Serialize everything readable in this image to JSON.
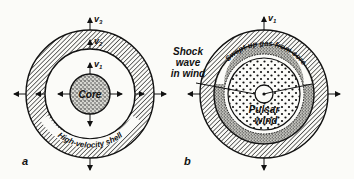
{
  "figure": {
    "panel_a": {
      "letter": "a",
      "labels": {
        "core": "Core",
        "shell": "High-velocity shell",
        "v1": "v",
        "v1_sub": "1",
        "v2": "v",
        "v2_sub": "2",
        "v3": "v",
        "v3_sub": "3"
      }
    },
    "panel_b": {
      "letter": "b",
      "labels": {
        "swept_gas": "Swept-up gas from core",
        "pulsar_wind_line1": "Pulsar",
        "pulsar_wind_line2": "wind",
        "v1": "v",
        "v1_sub": "1"
      }
    },
    "shock_label": {
      "line1": "Shock",
      "line2": "wave",
      "line3": "in wind"
    },
    "colors": {
      "ink": "#111111",
      "paper": "#fbfbf8"
    }
  }
}
